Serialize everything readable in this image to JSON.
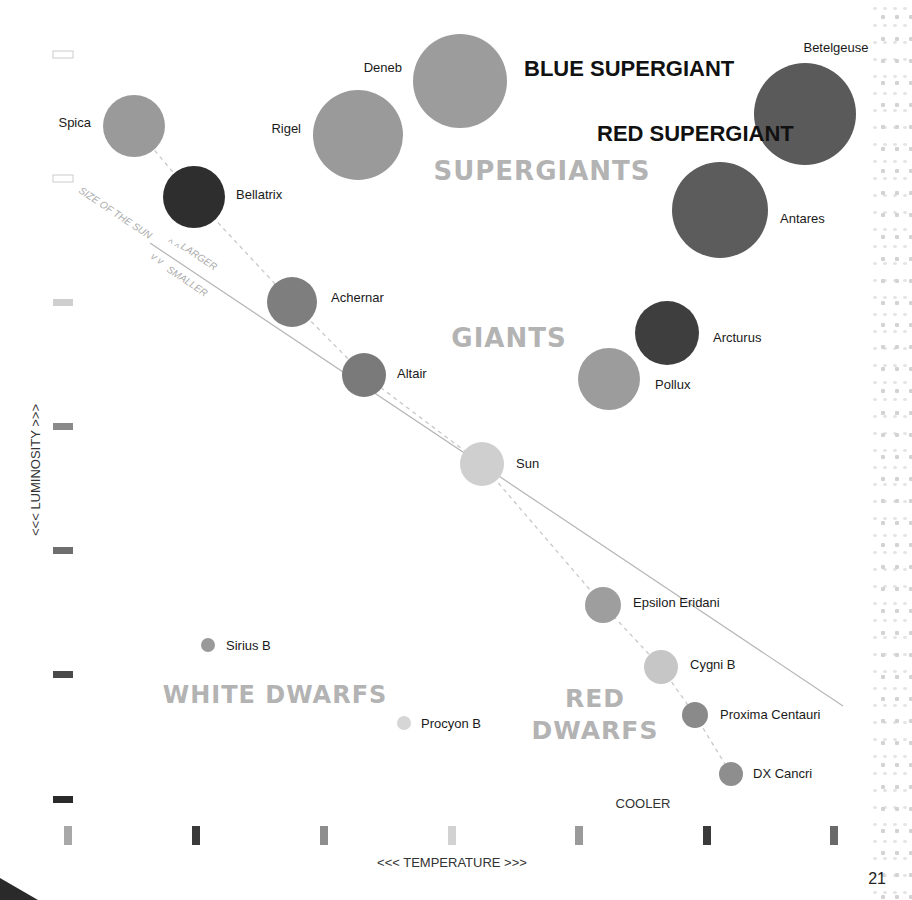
{
  "axes": {
    "y_label": "<<<  LUMINOSITY  >>>",
    "x_label": "<<<  TEMPERATURE  >>>",
    "x_end_label": "COOLER",
    "y_scale_bars": [
      {
        "y": 55,
        "fill": "#ffffff",
        "stroke": "#cccccc"
      },
      {
        "y": 179,
        "fill": "#ffffff",
        "stroke": "#cccccc"
      },
      {
        "y": 303,
        "fill": "#cfcfcf",
        "stroke": "none"
      },
      {
        "y": 427,
        "fill": "#8a8a8a",
        "stroke": "none"
      },
      {
        "y": 551,
        "fill": "#6e6e6e",
        "stroke": "none"
      },
      {
        "y": 675,
        "fill": "#4a4a4a",
        "stroke": "none"
      },
      {
        "y": 800,
        "fill": "#2a2a2a",
        "stroke": "none"
      }
    ],
    "x_scale_bars": [
      {
        "x": 68,
        "fill": "#a8a8a8"
      },
      {
        "x": 196,
        "fill": "#3a3a3a"
      },
      {
        "x": 324,
        "fill": "#8e8e8e"
      },
      {
        "x": 452,
        "fill": "#d2d2d2"
      },
      {
        "x": 579,
        "fill": "#9a9a9a"
      },
      {
        "x": 707,
        "fill": "#3a3a3a"
      },
      {
        "x": 834,
        "fill": "#6a6a6a"
      }
    ]
  },
  "regions": {
    "supergiants": "SUPERGIANTS",
    "giants": "GIANTS",
    "white_dwarfs": "WHITE DWARFS",
    "red_dwarfs_line1": "RED",
    "red_dwarfs_line2": "DWARFS"
  },
  "callouts": {
    "blue_supergiant": "BLUE SUPERGIANT",
    "red_supergiant": "RED SUPERGIANT"
  },
  "sun_line": {
    "label": "SIZE OF THE SUN",
    "larger": "LARGER",
    "smaller": "SMALLER",
    "arrow_up": "^ ^",
    "arrow_down": "v v"
  },
  "stars": [
    {
      "name": "Spica",
      "cx": 134,
      "cy": 126,
      "r": 31,
      "color": "#9a9a9a",
      "lx": 91,
      "ly": 127,
      "anchor": "end"
    },
    {
      "name": "Bellatrix",
      "cx": 194,
      "cy": 197,
      "r": 31,
      "color": "#2e2e2e",
      "lx": 236,
      "ly": 199,
      "anchor": "start"
    },
    {
      "name": "Rigel",
      "cx": 358,
      "cy": 135,
      "r": 45,
      "color": "#9a9a9a",
      "lx": 301,
      "ly": 133,
      "anchor": "end"
    },
    {
      "name": "Deneb",
      "cx": 460,
      "cy": 81,
      "r": 47,
      "color": "#9c9c9c",
      "lx": 402,
      "ly": 72,
      "anchor": "end"
    },
    {
      "name": "Betelgeuse",
      "cx": 805,
      "cy": 114,
      "r": 51,
      "color": "#5a5a5a",
      "lx": 836,
      "ly": 52,
      "anchor": "middle"
    },
    {
      "name": "Antares",
      "cx": 720,
      "cy": 210,
      "r": 48,
      "color": "#5c5c5c",
      "lx": 780,
      "ly": 223,
      "anchor": "start"
    },
    {
      "name": "Achernar",
      "cx": 292,
      "cy": 302,
      "r": 25,
      "color": "#7e7e7e",
      "lx": 331,
      "ly": 302,
      "anchor": "start"
    },
    {
      "name": "Altair",
      "cx": 364,
      "cy": 375,
      "r": 22,
      "color": "#7a7a7a",
      "lx": 397,
      "ly": 378,
      "anchor": "start"
    },
    {
      "name": "Arcturus",
      "cx": 667,
      "cy": 333,
      "r": 32,
      "color": "#3e3e3e",
      "lx": 713,
      "ly": 342,
      "anchor": "start"
    },
    {
      "name": "Pollux",
      "cx": 609,
      "cy": 379,
      "r": 31,
      "color": "#9c9c9c",
      "lx": 655,
      "ly": 389,
      "anchor": "start"
    },
    {
      "name": "Sun",
      "cx": 482,
      "cy": 464,
      "r": 22,
      "color": "#cfcfcf",
      "lx": 516,
      "ly": 468,
      "anchor": "start"
    },
    {
      "name": "Epsilon Eridani",
      "cx": 603,
      "cy": 605,
      "r": 18,
      "color": "#9e9e9e",
      "lx": 633,
      "ly": 607,
      "anchor": "start"
    },
    {
      "name": "Cygni B",
      "cx": 661,
      "cy": 667,
      "r": 17,
      "color": "#c6c6c6",
      "lx": 690,
      "ly": 669,
      "anchor": "start"
    },
    {
      "name": "Proxima Centauri",
      "cx": 695,
      "cy": 715,
      "r": 13,
      "color": "#8a8a8a",
      "lx": 720,
      "ly": 719,
      "anchor": "start"
    },
    {
      "name": "DX Cancri",
      "cx": 731,
      "cy": 774,
      "r": 12,
      "color": "#8e8e8e",
      "lx": 753,
      "ly": 778,
      "anchor": "start"
    },
    {
      "name": "Sirius B",
      "cx": 208,
      "cy": 645,
      "r": 7,
      "color": "#9a9a9a",
      "lx": 226,
      "ly": 650,
      "anchor": "start"
    },
    {
      "name": "Procyon B",
      "cx": 404,
      "cy": 723,
      "r": 7,
      "color": "#d6d6d6",
      "lx": 421,
      "ly": 728,
      "anchor": "start"
    }
  ],
  "page_number": "21"
}
